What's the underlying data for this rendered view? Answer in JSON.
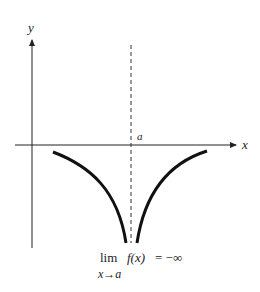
{
  "diagram": {
    "axes": {
      "x_label": "x",
      "y_label": "y"
    },
    "asymptote_label": "a",
    "formula": {
      "lim": "lim",
      "expr": "f(x)",
      "equals": "= −∞",
      "subscript": "x→a"
    },
    "colors": {
      "curve": "#111111",
      "axis": "#222222"
    }
  }
}
